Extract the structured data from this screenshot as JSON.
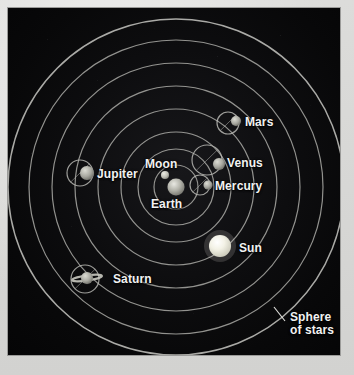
{
  "diagram": {
    "colors": {
      "background_panel": "#0d0d0f",
      "paper_margin": "#d8d8d6",
      "orbit_stroke": "#b9b9b4",
      "label_text": "#f2f2f2",
      "sun_body": "#f0efe4",
      "planet_body": "#b9b9b2"
    },
    "center": {
      "x": 168,
      "y": 179
    },
    "spheres": [
      {
        "name": "moon-sphere",
        "radius": 22
      },
      {
        "name": "mercury-sphere",
        "radius": 38
      },
      {
        "name": "venus-sphere",
        "radius": 55
      },
      {
        "name": "sun-sphere",
        "radius": 78
      },
      {
        "name": "mars-sphere",
        "radius": 101
      },
      {
        "name": "jupiter-sphere",
        "radius": 124
      },
      {
        "name": "saturn-sphere",
        "radius": 147
      },
      {
        "name": "sphere-of-stars",
        "radius": 168
      }
    ],
    "bodies": [
      {
        "id": "earth",
        "label": "Earth",
        "label_x": 143,
        "label_y": 190,
        "body_x": 168,
        "body_y": 179,
        "body_r": 8.5,
        "has_epicycle": false,
        "epicycle_r": 0
      },
      {
        "id": "moon",
        "label": "Moon",
        "label_x": 137,
        "label_y": 150,
        "body_x": 157,
        "body_y": 167,
        "body_r": 4,
        "has_epicycle": false,
        "epicycle_r": 0
      },
      {
        "id": "mercury",
        "label": "Mercury",
        "label_x": 207,
        "label_y": 172,
        "body_x": 200,
        "body_y": 177,
        "body_r": 4.5,
        "has_epicycle": true,
        "epicycle_cx": 192,
        "epicycle_cy": 177,
        "epicycle_r": 10
      },
      {
        "id": "venus",
        "label": "Venus",
        "label_x": 219,
        "label_y": 149,
        "body_x": 211,
        "body_y": 156,
        "body_r": 6,
        "has_epicycle": true,
        "epicycle_cx": 199,
        "epicycle_cy": 152,
        "epicycle_r": 15
      },
      {
        "id": "sun",
        "label": "Sun",
        "label_x": 231,
        "label_y": 234,
        "body_x": 212,
        "body_y": 238,
        "body_r": 11,
        "has_epicycle": false,
        "epicycle_r": 0
      },
      {
        "id": "mars",
        "label": "Mars",
        "label_x": 237,
        "label_y": 108,
        "body_x": 228,
        "body_y": 113,
        "body_r": 5,
        "has_epicycle": true,
        "epicycle_cx": 220,
        "epicycle_cy": 115,
        "epicycle_r": 11
      },
      {
        "id": "jupiter",
        "label": "Jupiter",
        "label_x": 89,
        "label_y": 160,
        "body_x": 79,
        "body_y": 165,
        "body_r": 7,
        "has_epicycle": true,
        "epicycle_cx": 72,
        "epicycle_cy": 165,
        "epicycle_r": 13
      },
      {
        "id": "saturn",
        "label": "Saturn",
        "label_x": 105,
        "label_y": 265,
        "body_x": 79,
        "body_y": 270,
        "body_r": 6,
        "has_epicycle": true,
        "epicycle_cx": 77,
        "epicycle_cy": 271,
        "epicycle_r": 14
      }
    ],
    "annotation": {
      "id": "sphere-of-stars",
      "line1": "Sphere",
      "line2": "of stars",
      "label_x": 282,
      "label_y": 303,
      "leader_x1": 266,
      "leader_y1": 299,
      "leader_x2": 277,
      "leader_y2": 313
    }
  }
}
